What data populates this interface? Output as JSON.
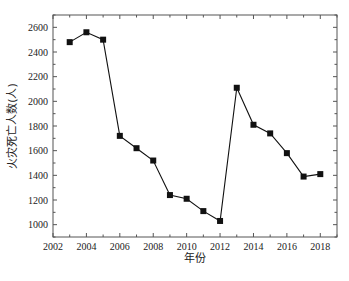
{
  "chart_data": {
    "type": "line",
    "title": "",
    "xlabel": "年份",
    "ylabel": "火灾死亡人数(人)",
    "xlim": [
      2002,
      2019
    ],
    "ylim": [
      900,
      2700
    ],
    "x_ticks": [
      2002,
      2004,
      2006,
      2008,
      2010,
      2012,
      2014,
      2016,
      2018
    ],
    "y_ticks": [
      1000,
      1200,
      1400,
      1600,
      1800,
      2000,
      2200,
      2400,
      2600
    ],
    "grid": false,
    "legend": null,
    "marker": "square",
    "x": [
      2003,
      2004,
      2005,
      2006,
      2007,
      2008,
      2009,
      2010,
      2011,
      2012,
      2013,
      2014,
      2015,
      2016,
      2017,
      2018
    ],
    "series": [
      {
        "name": "火灾死亡人数",
        "values": [
          2480,
          2560,
          2500,
          1720,
          1620,
          1520,
          1240,
          1210,
          1110,
          1030,
          2110,
          1810,
          1740,
          1580,
          1390,
          1410
        ]
      }
    ]
  },
  "colors": {
    "line": "#111111",
    "marker": "#111111",
    "axis": "#555555",
    "background": "#ffffff"
  }
}
